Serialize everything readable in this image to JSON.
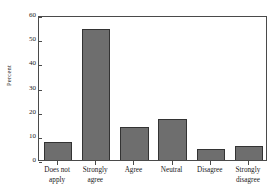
{
  "chart_data": {
    "type": "bar",
    "title": "",
    "subtitle": "",
    "xlabel": "",
    "ylabel": "Percent",
    "categories": [
      "Does not apply",
      "Strongly agree",
      "Agree",
      "Neutral",
      "Disagree",
      "Strongly disagree"
    ],
    "category_lines": [
      [
        "Does not",
        "apply"
      ],
      [
        "Strongly",
        "agree"
      ],
      [
        "Agree"
      ],
      [
        "Neutral"
      ],
      [
        "Disagree"
      ],
      [
        "Strongly",
        "disagree"
      ]
    ],
    "values": [
      7.3,
      54.3,
      13.6,
      17.0,
      4.6,
      6.0
    ],
    "ylim": [
      0,
      60
    ],
    "yticks": [
      0,
      10,
      20,
      30,
      40,
      50,
      60
    ],
    "ytick_labels": [
      "0",
      "10",
      "20",
      "30",
      "40",
      "50",
      "60"
    ],
    "grid": false,
    "legend": false,
    "legend_position": "none",
    "bar_fill_color": "#6e6e6e",
    "bar_edge_color": "#333333",
    "frame_color": "#4a4a4a",
    "background_color": "#ffffff"
  }
}
